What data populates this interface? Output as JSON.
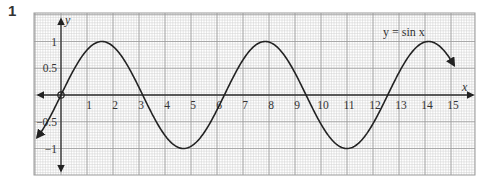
{
  "question_number": "1",
  "chart_data": {
    "type": "line",
    "title": "",
    "function_label": "y = sin x",
    "xlabel": "x",
    "ylabel": "y",
    "xlim": [
      -1,
      15.8
    ],
    "ylim": [
      -1.5,
      1.6
    ],
    "x_ticks": [
      1,
      2,
      3,
      4,
      5,
      6,
      7,
      8,
      9,
      10,
      11,
      12,
      13,
      14,
      15
    ],
    "y_ticks": [
      {
        "value": 1,
        "label": "1"
      },
      {
        "value": 0.5,
        "label": "0.5"
      },
      {
        "value": -0.5,
        "label": "−0.5"
      },
      {
        "value": -1,
        "label": "−1"
      }
    ],
    "origin_marker": "circle",
    "grid": {
      "major_x": 1,
      "major_y": 0.5,
      "minor_x": 0.1,
      "minor_y": 0.05,
      "on": true
    },
    "series": [
      {
        "name": "y = sin x",
        "x_start": -0.92,
        "x_end": 15.15,
        "function": "sin",
        "key_points": [
          {
            "x": 0,
            "y": 0
          },
          {
            "x": 1.57,
            "y": 1
          },
          {
            "x": 3.14,
            "y": 0
          },
          {
            "x": 4.71,
            "y": -1
          },
          {
            "x": 6.28,
            "y": 0
          },
          {
            "x": 7.85,
            "y": 1
          },
          {
            "x": 9.42,
            "y": 0
          },
          {
            "x": 11.0,
            "y": -1
          },
          {
            "x": 12.57,
            "y": 0
          },
          {
            "x": 14.14,
            "y": 1
          }
        ]
      }
    ],
    "colors": {
      "grid_major": "#9a9a9a",
      "grid_minor": "#cfcfcf",
      "curve": "#222222",
      "axis": "#333333"
    }
  }
}
